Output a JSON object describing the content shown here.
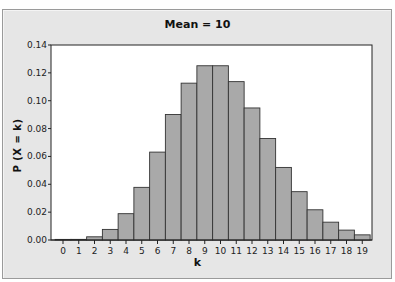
{
  "chart_data": {
    "type": "bar",
    "title": "Mean = 10",
    "xlabel": "k",
    "ylabel": "P (X = k)",
    "categories": [
      "0",
      "1",
      "2",
      "3",
      "4",
      "5",
      "6",
      "7",
      "8",
      "9",
      "10",
      "11",
      "12",
      "13",
      "14",
      "15",
      "16",
      "17",
      "18",
      "19"
    ],
    "values": [
      5e-05,
      0.00045,
      0.0023,
      0.0076,
      0.0189,
      0.0378,
      0.0631,
      0.0901,
      0.1126,
      0.1251,
      0.1251,
      0.1137,
      0.0948,
      0.0729,
      0.0521,
      0.0347,
      0.0217,
      0.0128,
      0.0071,
      0.0037
    ],
    "ylim": [
      0,
      0.14
    ],
    "yticks": [
      "0.00",
      "0.02",
      "0.04",
      "0.06",
      "0.08",
      "0.10",
      "0.12",
      "0.14"
    ],
    "grid": false,
    "legend": null,
    "colors": {
      "bar_fill": "#a9a9a9",
      "bar_edge": "#333333",
      "frame_bg": "#e6e6e6",
      "plot_bg": "#ffffff"
    }
  }
}
